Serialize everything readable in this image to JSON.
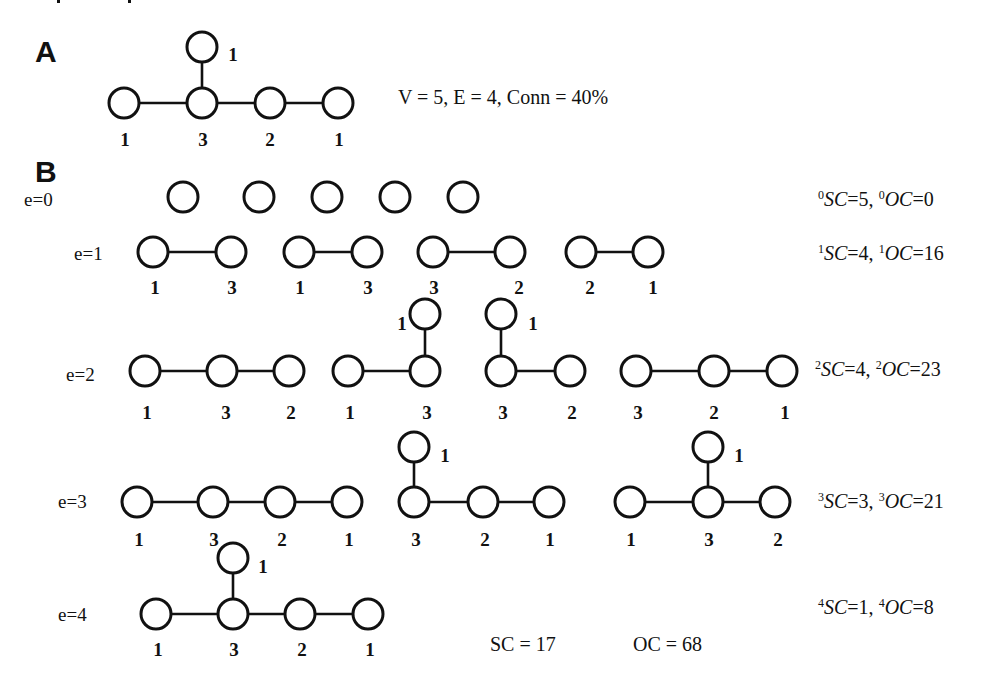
{
  "panel_a": {
    "letter": "A",
    "summary": "V = 5, E = 4, Conn = 40%",
    "graph": {
      "nodes": [
        {
          "x": 124,
          "y": 103,
          "deg": "1",
          "lx": 125,
          "ly": 146
        },
        {
          "x": 202,
          "y": 103,
          "deg": "3",
          "lx": 203,
          "ly": 146
        },
        {
          "x": 270,
          "y": 103,
          "deg": "2",
          "lx": 270,
          "ly": 146
        },
        {
          "x": 338,
          "y": 103,
          "deg": "1",
          "lx": 339,
          "ly": 146
        },
        {
          "x": 202,
          "y": 47,
          "deg": "1",
          "lx": 233,
          "ly": 61
        }
      ],
      "edges": [
        [
          0,
          1
        ],
        [
          1,
          2
        ],
        [
          2,
          3
        ],
        [
          1,
          4
        ]
      ]
    }
  },
  "panel_b": {
    "letter": "B",
    "rows": [
      {
        "label": "e=0",
        "label_x": 24,
        "label_y": 206,
        "stats": {
          "e": "0",
          "sc": "5",
          "oc": "0",
          "x": 818,
          "y": 206
        },
        "subgraphs": [
          {
            "nodes": [
              {
                "x": 183,
                "y": 197
              }
            ],
            "edges": []
          },
          {
            "nodes": [
              {
                "x": 259,
                "y": 197
              }
            ],
            "edges": []
          },
          {
            "nodes": [
              {
                "x": 327,
                "y": 197
              }
            ],
            "edges": []
          },
          {
            "nodes": [
              {
                "x": 395,
                "y": 197
              }
            ],
            "edges": []
          },
          {
            "nodes": [
              {
                "x": 463,
                "y": 197
              }
            ],
            "edges": []
          }
        ]
      },
      {
        "label": "e=1",
        "label_x": 74,
        "label_y": 260,
        "stats": {
          "e": "1",
          "sc": "4",
          "oc": "16",
          "x": 818,
          "y": 260
        },
        "subgraphs": [
          {
            "nodes": [
              {
                "x": 153,
                "y": 252,
                "deg": "1",
                "lx": 155,
                "ly": 294
              },
              {
                "x": 231,
                "y": 252,
                "deg": "3",
                "lx": 232,
                "ly": 294
              }
            ],
            "edges": [
              [
                0,
                1
              ]
            ]
          },
          {
            "nodes": [
              {
                "x": 299,
                "y": 252,
                "deg": "1",
                "lx": 300,
                "ly": 294
              },
              {
                "x": 367,
                "y": 252,
                "deg": "3",
                "lx": 368,
                "ly": 294
              }
            ],
            "edges": [
              [
                0,
                1
              ]
            ]
          },
          {
            "nodes": [
              {
                "x": 433,
                "y": 252,
                "deg": "3",
                "lx": 434,
                "ly": 294
              },
              {
                "x": 510,
                "y": 252,
                "deg": "2",
                "lx": 519,
                "ly": 294
              }
            ],
            "edges": [
              [
                0,
                1
              ]
            ]
          },
          {
            "nodes": [
              {
                "x": 581,
                "y": 252,
                "deg": "2",
                "lx": 590,
                "ly": 294
              },
              {
                "x": 648,
                "y": 252,
                "deg": "1",
                "lx": 653,
                "ly": 294
              }
            ],
            "edges": [
              [
                0,
                1
              ]
            ]
          }
        ]
      },
      {
        "label": "e=2",
        "label_x": 66,
        "label_y": 381,
        "stats": {
          "e": "2",
          "sc": "4",
          "oc": "23",
          "x": 815,
          "y": 376
        },
        "subgraphs": [
          {
            "nodes": [
              {
                "x": 145,
                "y": 371,
                "deg": "1",
                "lx": 147,
                "ly": 419
              },
              {
                "x": 222,
                "y": 371,
                "deg": "3",
                "lx": 226,
                "ly": 419
              },
              {
                "x": 289,
                "y": 371,
                "deg": "2",
                "lx": 291,
                "ly": 419
              }
            ],
            "edges": [
              [
                0,
                1
              ],
              [
                1,
                2
              ]
            ]
          },
          {
            "nodes": [
              {
                "x": 348,
                "y": 371,
                "deg": "1",
                "lx": 350,
                "ly": 419
              },
              {
                "x": 425,
                "y": 371,
                "deg": "3",
                "lx": 427,
                "ly": 419
              },
              {
                "x": 425,
                "y": 314,
                "deg": "1",
                "lx": 402,
                "ly": 330
              }
            ],
            "edges": [
              [
                0,
                1
              ],
              [
                1,
                2
              ]
            ]
          },
          {
            "nodes": [
              {
                "x": 501,
                "y": 371,
                "deg": "3",
                "lx": 503,
                "ly": 419
              },
              {
                "x": 570,
                "y": 371,
                "deg": "2",
                "lx": 572,
                "ly": 419
              },
              {
                "x": 501,
                "y": 314,
                "deg": "1",
                "lx": 533,
                "ly": 330
              }
            ],
            "edges": [
              [
                0,
                1
              ],
              [
                0,
                2
              ]
            ]
          },
          {
            "nodes": [
              {
                "x": 636,
                "y": 371,
                "deg": "3",
                "lx": 638,
                "ly": 419
              },
              {
                "x": 714,
                "y": 371,
                "deg": "2",
                "lx": 714,
                "ly": 419
              },
              {
                "x": 782,
                "y": 371,
                "deg": "1",
                "lx": 785,
                "ly": 419
              }
            ],
            "edges": [
              [
                0,
                1
              ],
              [
                1,
                2
              ]
            ]
          }
        ]
      },
      {
        "label": "e=3",
        "label_x": 58,
        "label_y": 508,
        "stats": {
          "e": "3",
          "sc": "3",
          "oc": "21",
          "x": 818,
          "y": 508
        },
        "subgraphs": [
          {
            "nodes": [
              {
                "x": 137,
                "y": 502,
                "deg": "1",
                "lx": 139,
                "ly": 546
              },
              {
                "x": 213,
                "y": 502,
                "deg": "3",
                "lx": 214,
                "ly": 546
              },
              {
                "x": 280,
                "y": 502,
                "deg": "2",
                "lx": 282,
                "ly": 546
              },
              {
                "x": 347,
                "y": 502,
                "deg": "1",
                "lx": 349,
                "ly": 546
              }
            ],
            "edges": [
              [
                0,
                1
              ],
              [
                1,
                2
              ],
              [
                2,
                3
              ]
            ]
          },
          {
            "nodes": [
              {
                "x": 414,
                "y": 502,
                "deg": "3",
                "lx": 416,
                "ly": 546
              },
              {
                "x": 483,
                "y": 502,
                "deg": "2",
                "lx": 485,
                "ly": 546
              },
              {
                "x": 549,
                "y": 502,
                "deg": "1",
                "lx": 550,
                "ly": 546
              },
              {
                "x": 414,
                "y": 447,
                "deg": "1",
                "lx": 445,
                "ly": 462
              }
            ],
            "edges": [
              [
                0,
                1
              ],
              [
                1,
                2
              ],
              [
                0,
                3
              ]
            ]
          },
          {
            "nodes": [
              {
                "x": 630,
                "y": 502,
                "deg": "1",
                "lx": 631,
                "ly": 546
              },
              {
                "x": 708,
                "y": 502,
                "deg": "3",
                "lx": 709,
                "ly": 546
              },
              {
                "x": 775,
                "y": 502,
                "deg": "2",
                "lx": 778,
                "ly": 546
              },
              {
                "x": 708,
                "y": 447,
                "deg": "1",
                "lx": 739,
                "ly": 462
              }
            ],
            "edges": [
              [
                0,
                1
              ],
              [
                1,
                2
              ],
              [
                1,
                3
              ]
            ]
          }
        ]
      },
      {
        "label": "e=4",
        "label_x": 58,
        "label_y": 621,
        "stats": {
          "e": "4",
          "sc": "1",
          "oc": "8",
          "x": 818,
          "y": 614
        },
        "subgraphs": [
          {
            "nodes": [
              {
                "x": 156,
                "y": 614,
                "deg": "1",
                "lx": 158,
                "ly": 656
              },
              {
                "x": 233,
                "y": 614,
                "deg": "3",
                "lx": 234,
                "ly": 656
              },
              {
                "x": 300,
                "y": 614,
                "deg": "2",
                "lx": 302,
                "ly": 656
              },
              {
                "x": 368,
                "y": 614,
                "deg": "1",
                "lx": 370,
                "ly": 656
              },
              {
                "x": 233,
                "y": 558,
                "deg": "1",
                "lx": 263,
                "ly": 573
              }
            ],
            "edges": [
              [
                0,
                1
              ],
              [
                1,
                2
              ],
              [
                2,
                3
              ],
              [
                1,
                4
              ]
            ]
          }
        ]
      }
    ],
    "totals": {
      "sc_label": "SC = 17",
      "oc_label": "OC = 68"
    }
  }
}
